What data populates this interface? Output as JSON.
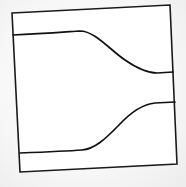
{
  "diagram": {
    "type": "channel-constriction",
    "frame": {
      "corners": [
        [
          12,
          13
        ],
        [
          170,
          5
        ],
        [
          177,
          164
        ],
        [
          20,
          172
        ]
      ],
      "stroke": "#1a1a1a"
    },
    "curves": [
      {
        "name": "upper-boundary",
        "path": "M13,35 C40,34 65,32 80,31 C95,31 110,50 125,60 C138,69 148,73 157,73 L173,72",
        "stroke": "#111111"
      },
      {
        "name": "lower-boundary",
        "path": "M20,153 C45,152 68,151 82,150 C96,149 108,136 118,126 C130,113 142,104 155,103 L175,102",
        "stroke": "#111111"
      }
    ],
    "background": "#ffffff",
    "page_background": "#efefef"
  }
}
